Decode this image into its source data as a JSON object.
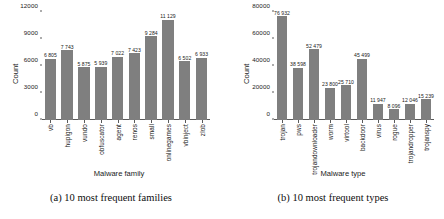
{
  "figure": {
    "panels": [
      {
        "id": "panel-a",
        "caption": "(a) 10 most frequent families",
        "xlabel": "Malware family",
        "ylabel": "Count"
      },
      {
        "id": "panel-b",
        "caption": "(b) 10 most frequent types",
        "xlabel": "Malware type",
        "ylabel": "Count"
      }
    ]
  },
  "chart_data": [
    {
      "type": "bar",
      "title": "(a) 10 most frequent families",
      "xlabel": "Malware family",
      "ylabel": "Count",
      "ylim": [
        0,
        12000
      ],
      "yticks": [
        0,
        3000,
        6000,
        9000,
        12000
      ],
      "ytick_labels": [
        "0",
        "3000",
        "6000",
        "9000",
        "12000"
      ],
      "grid": false,
      "legend": "none",
      "bar_color": "#7f7f7f",
      "categories": [
        "vb",
        "hupigon",
        "vundo",
        "obfuscator",
        "agent",
        "renos",
        "small",
        "onlinegames",
        "vbinject",
        "zlob"
      ],
      "values": [
        6805,
        7743,
        5875,
        5939,
        7022,
        7423,
        9284,
        11129,
        6502,
        6933
      ],
      "value_labels": [
        "6 805",
        "7 743",
        "5 875",
        "5 939",
        "7 022",
        "7 423",
        "9 284",
        "11 129",
        "6 502",
        "6 933"
      ]
    },
    {
      "type": "bar",
      "title": "(b) 10 most frequent types",
      "xlabel": "Malware type",
      "ylabel": "Count",
      "ylim": [
        0,
        80000
      ],
      "yticks": [
        0,
        20000,
        40000,
        60000,
        80000
      ],
      "ytick_labels": [
        "0",
        "20000",
        "40000",
        "60000",
        "80000"
      ],
      "grid": false,
      "legend": "none",
      "bar_color": "#7f7f7f",
      "categories": [
        "trojan",
        "pws",
        "trojandownloader",
        "worm",
        "virtool",
        "backdoor",
        "virus",
        "rogue",
        "trojandropper",
        "trojanspy"
      ],
      "values": [
        76932,
        38598,
        52479,
        23800,
        25710,
        45499,
        11947,
        8096,
        12046,
        15239
      ],
      "value_labels": [
        "76 932",
        "38 598",
        "52 479",
        "23 800",
        "25 710",
        "45 499",
        "11 947",
        "8 096",
        "12 046",
        "15 239"
      ]
    }
  ]
}
